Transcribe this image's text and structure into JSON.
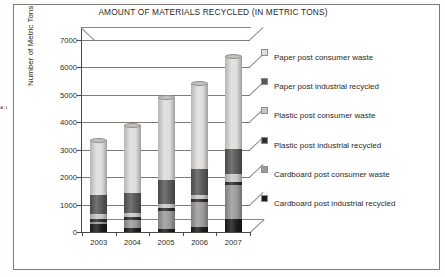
{
  "page": {
    "edge_artifact_text": "■ : ■ ▮ ▪ ┆ ▪ ┆ ▪ ╷ ▪ ┊ ▫ ╎ ▪ ┆ ▫ ┊ ▪ ╷ ▫ ┆ ▪"
  },
  "chart_data": {
    "type": "bar",
    "subtype": "stacked-column-3d",
    "title": "AMOUNT OF MATERIALS RECYCLED (IN METRIC TONS)",
    "xlabel": "",
    "ylabel": "Number of Metric Tons",
    "categories": [
      "2003",
      "2004",
      "2005",
      "2006",
      "2007"
    ],
    "ylim": [
      0,
      7000
    ],
    "yticks": [
      0,
      1000,
      2000,
      3000,
      4000,
      5000,
      6000,
      7000
    ],
    "ytick_labels": [
      "0",
      "1000",
      "2000",
      "3000",
      "4000",
      "5000",
      "6000",
      "7000"
    ],
    "grid": true,
    "legend_position": "right",
    "stack_order_bottom_to_top": [
      "Cardboard post industrial recycled",
      "Cardboard post consumer waste",
      "Plastic post industrial recycled",
      "Plastic post consumer waste",
      "Paper post industrial recycled",
      "Paper post consumer waste"
    ],
    "series": [
      {
        "name": "Cardboard post industrial recycled",
        "color": "#1c1c1c",
        "values": [
          300,
          140,
          120,
          180,
          470
        ]
      },
      {
        "name": "Cardboard post consumer waste",
        "color": "#9b9a98",
        "values": [
          60,
          310,
          640,
          900,
          1250
        ]
      },
      {
        "name": "Plastic post industrial recycled",
        "color": "#2e2e2e",
        "values": [
          120,
          100,
          110,
          110,
          120
        ]
      },
      {
        "name": "Plastic post consumer waste",
        "color": "#c8c8c6",
        "values": [
          160,
          130,
          160,
          150,
          270
        ]
      },
      {
        "name": "Paper post industrial recycled",
        "color": "#59595a",
        "values": [
          720,
          760,
          860,
          960,
          900
        ]
      },
      {
        "name": "Paper post consumer waste",
        "color": "#dedddb",
        "values": [
          1990,
          2460,
          3010,
          3100,
          3390
        ]
      }
    ],
    "totals": [
      3350,
      3900,
      4900,
      5400,
      6400
    ]
  },
  "legend": {
    "items": [
      {
        "label": "Paper post consumer waste",
        "color": "#dedddb"
      },
      {
        "label": "Paper post industrial recycled",
        "color": "#59595a"
      },
      {
        "label": "Plastic post consumer waste",
        "color": "#c8c8c6"
      },
      {
        "label": "Plastic post industrial recycled",
        "color": "#2e2e2e"
      },
      {
        "label": "Cardboard post consumer waste",
        "color": "#9b9a98"
      },
      {
        "label": "Cardboard post industrial recycled",
        "color": "#1c1c1c"
      }
    ]
  }
}
